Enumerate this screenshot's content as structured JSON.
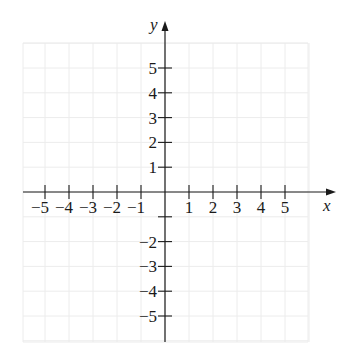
{
  "chart_data": {
    "type": "scatter",
    "title": "",
    "xlabel": "x",
    "ylabel": "y",
    "xlim": [
      -6,
      6
    ],
    "ylim": [
      -7,
      6
    ],
    "grid": true,
    "x_ticks": [
      -5,
      -4,
      -3,
      -2,
      -1,
      1,
      2,
      3,
      4,
      5
    ],
    "y_ticks": [
      5,
      4,
      3,
      2,
      1,
      -2,
      -3,
      -4,
      -5
    ],
    "x_tick_labels": [
      "−5",
      "−4",
      "−3",
      "−2",
      "−1",
      "1",
      "2",
      "3",
      "4",
      "5"
    ],
    "y_tick_labels": [
      "5",
      "4",
      "3",
      "2",
      "1",
      "−2",
      "−3",
      "−4",
      "−5"
    ],
    "series": []
  },
  "labels": {
    "x_axis": "x",
    "y_axis": "y"
  }
}
